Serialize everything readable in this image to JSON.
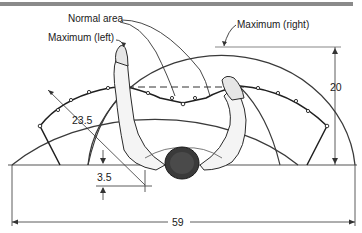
{
  "diagram": {
    "labels": {
      "normal_area": "Normal area",
      "maximum_left": "Maximum (left)",
      "maximum_right": "Maximum (right)"
    },
    "dimensions": {
      "reach_radius": "23.5",
      "depth": "20",
      "offset": "3.5",
      "total_width": "59"
    },
    "colors": {
      "line": "#2b2b2b",
      "rule": "#8a8a8a",
      "background": "#ffffff"
    }
  }
}
